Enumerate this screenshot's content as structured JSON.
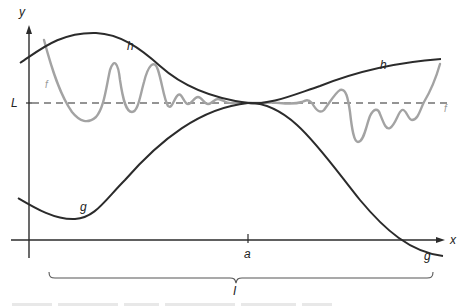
{
  "diagram": {
    "type": "squeeze-theorem-illustration",
    "axes": {
      "x_label": "x",
      "y_label": "y",
      "origin_px": [
        29,
        240
      ]
    },
    "limit_line": {
      "label": "L",
      "style": "dashed",
      "y_px": 103
    },
    "point": {
      "label": "a",
      "x_px": 248
    },
    "interval": {
      "label": "I",
      "from_px": 49,
      "to_px": 433
    },
    "curves": {
      "h": {
        "label": "h",
        "color": "#2b2b2b",
        "role": "upper bound"
      },
      "g": {
        "label": "g",
        "color": "#2b2b2b",
        "role": "lower bound"
      },
      "f": {
        "label": "f",
        "color": "#a3a3a3",
        "role": "squeezed function"
      }
    },
    "curve_labels": [
      {
        "name": "h",
        "text": "h",
        "x": 127,
        "y": 40
      },
      {
        "name": "h",
        "text": "h",
        "x": 380,
        "y": 59
      },
      {
        "name": "g",
        "text": "g",
        "x": 80,
        "y": 202
      },
      {
        "name": "g",
        "text": "g",
        "x": 424,
        "y": 251
      },
      {
        "name": "f",
        "text": "f",
        "x": 45,
        "y": 80
      },
      {
        "name": "f",
        "text": "f",
        "x": 444,
        "y": 104
      }
    ]
  }
}
